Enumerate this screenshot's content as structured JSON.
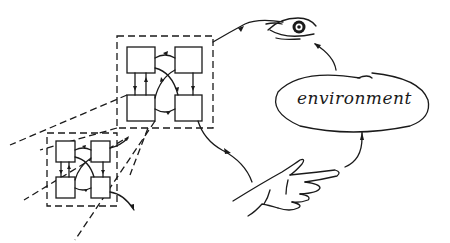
{
  "diagram": {
    "type": "perception-action loop sketch",
    "environment": {
      "label": "environment"
    },
    "nodes": {
      "eye": {
        "icon": "eye-icon",
        "role": "sensor"
      },
      "hand": {
        "icon": "pointing-hand-icon",
        "role": "actuator"
      },
      "network": {
        "icon": "network-of-four-units",
        "units": 4,
        "role": "agent internal network"
      },
      "network_zoom": {
        "icon": "network-of-four-units",
        "units": 4,
        "role": "magnified sub-network"
      }
    },
    "flow": [
      {
        "from": "environment",
        "to": "eye"
      },
      {
        "from": "eye",
        "to": "network"
      },
      {
        "from": "network",
        "to": "hand"
      },
      {
        "from": "hand",
        "to": "environment"
      }
    ],
    "colors": {
      "ink": "#1a1a1a",
      "background": "#ffffff"
    }
  }
}
